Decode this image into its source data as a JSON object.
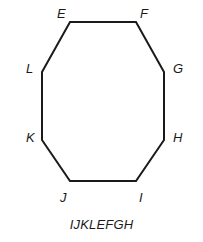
{
  "figure": {
    "caption": "IJKLEFGH",
    "shape_name": "octagon",
    "stroke_color": "#1a1a1a",
    "fill_color": "#ffffff",
    "background_color": "#ffffff",
    "stroke_width": 2,
    "vertices": [
      {
        "label": "E",
        "x": 70,
        "y": 22,
        "label_x": 57,
        "label_y": 7
      },
      {
        "label": "F",
        "x": 136,
        "y": 22,
        "label_x": 140,
        "label_y": 7
      },
      {
        "label": "G",
        "x": 164,
        "y": 72,
        "label_x": 173,
        "label_y": 62
      },
      {
        "label": "H",
        "x": 164,
        "y": 140,
        "label_x": 173,
        "label_y": 131
      },
      {
        "label": "I",
        "x": 136,
        "y": 181,
        "label_x": 139,
        "label_y": 191
      },
      {
        "label": "J",
        "x": 70,
        "y": 181,
        "label_x": 60,
        "label_y": 191
      },
      {
        "label": "K",
        "x": 42,
        "y": 140,
        "label_x": 26,
        "label_y": 131
      },
      {
        "label": "L",
        "x": 42,
        "y": 72,
        "label_x": 26,
        "label_y": 62
      }
    ],
    "polygon_points": "70,22 136,22 164,72 164,140 136,181 70,181 42,140 42,72",
    "caption_x": 0,
    "caption_y": 218
  }
}
